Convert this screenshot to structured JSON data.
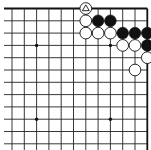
{
  "board": {
    "fragment": "top-right corner",
    "columns": 12,
    "rows": 12,
    "origin_x": 12,
    "origin_y": 8.5,
    "spacing": 12.3,
    "left_open_extend_to": 4,
    "bottom_open_extend_to": 150,
    "edges": [
      "top",
      "right"
    ],
    "colors": {
      "line": "#222222",
      "black_stone": "#111111",
      "white_stone": "#ffffff",
      "background": "#ffffff"
    }
  },
  "star_points": [
    {
      "col": 2,
      "row": 3
    },
    {
      "col": 8,
      "row": 3
    },
    {
      "col": 2,
      "row": 9
    },
    {
      "col": 8,
      "row": 9
    }
  ],
  "stones": [
    {
      "color": "white",
      "col": 6,
      "row": 0,
      "marker": "triangle"
    },
    {
      "color": "white",
      "col": 6,
      "row": 1
    },
    {
      "color": "black",
      "col": 7,
      "row": 1
    },
    {
      "color": "black",
      "col": 8,
      "row": 1
    },
    {
      "color": "white",
      "col": 6,
      "row": 2
    },
    {
      "color": "white",
      "col": 7,
      "row": 2
    },
    {
      "color": "white",
      "col": 8,
      "row": 2
    },
    {
      "color": "black",
      "col": 9,
      "row": 2
    },
    {
      "color": "black",
      "col": 10,
      "row": 2
    },
    {
      "color": "black",
      "col": 11,
      "row": 2
    },
    {
      "color": "white",
      "col": 9,
      "row": 3
    },
    {
      "color": "white",
      "col": 10,
      "row": 3
    },
    {
      "color": "black",
      "col": 11,
      "row": 3
    },
    {
      "color": "white",
      "col": 11,
      "row": 4
    },
    {
      "color": "white",
      "col": 10,
      "row": 5
    }
  ]
}
